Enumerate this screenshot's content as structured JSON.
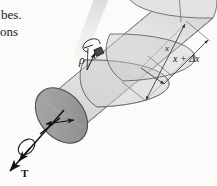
{
  "figure": {
    "kind": "torsion-shaft-diagram",
    "caption_fragments": {
      "line1": "bes.",
      "line2": "ons"
    },
    "labels": {
      "radial_position": "ρ",
      "outer_radius": "c",
      "torque": "T",
      "axial_station": "x",
      "axial_station_plus_delta": "x + Δx"
    },
    "colors": {
      "background": "#fbfbfa",
      "shaft_body": "#dcdcdc",
      "shaft_body_highlight": "#eeeeee",
      "end_cap": "#9a9a9a",
      "mid_section": "#c9c9c9",
      "outline": "#4a4a4a",
      "ink": "#1a1a1a",
      "scan_streak": "#d8d8d8"
    }
  }
}
